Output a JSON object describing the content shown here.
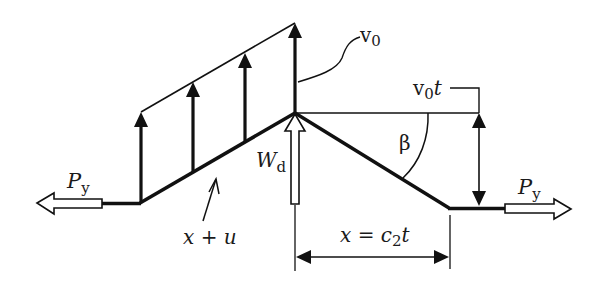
{
  "diagram": {
    "type": "mechanics-free-body",
    "colors": {
      "stroke": "#111111",
      "background": "#ffffff",
      "hollow_fill": "#ffffff"
    },
    "labels": {
      "tension_left": {
        "main": "P",
        "sub": "y"
      },
      "tension_right": {
        "main": "P",
        "sub": "y"
      },
      "velocity": {
        "main": "v",
        "sub": "0"
      },
      "displacement": {
        "main": "v",
        "sub": "0",
        "suffix": "t"
      },
      "angle": "β",
      "load": {
        "main": "W",
        "sub": "d"
      },
      "material_coord": "x + u",
      "wave_front": {
        "prefix": "x = c",
        "sub": "2",
        "suffix": "t"
      }
    },
    "elements": [
      "left tension hollow arrow",
      "right tension hollow arrow",
      "deflected string profile",
      "four particle velocity arrows",
      "velocity envelope line",
      "impact load hollow arrow",
      "reference horizontal line",
      "angle arc beta",
      "vertical displacement double arrow",
      "horizontal wave-front dimension arrow"
    ]
  }
}
